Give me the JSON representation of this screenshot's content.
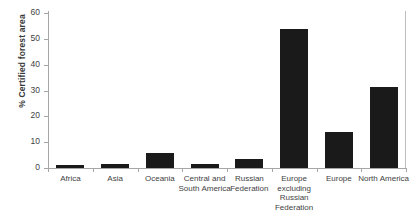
{
  "chart_data": {
    "type": "bar",
    "title": "",
    "subtitle": "",
    "xlabel": "",
    "ylabel": "% Certified forest area",
    "ylim": [
      0,
      60
    ],
    "yticks": [
      0,
      10,
      20,
      30,
      40,
      50,
      60
    ],
    "grid": false,
    "legend": null,
    "bar_color": "#1a1a1a",
    "axis_color": "#a6a6a6",
    "categories": [
      "Africa",
      "Asia",
      "Oceania",
      "Central and South America",
      "Russian Federation",
      "Europe excluding Russian Federation",
      "Europe",
      "North America"
    ],
    "values": [
      1,
      1.5,
      6,
      1.5,
      3.5,
      54,
      14,
      31.5
    ]
  }
}
